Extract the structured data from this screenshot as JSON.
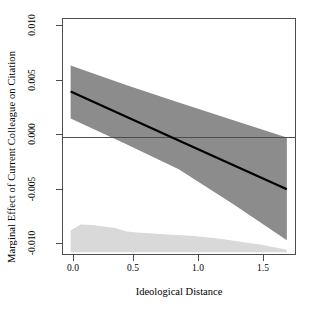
{
  "chart_data": {
    "type": "line",
    "title": "",
    "xlabel": "Ideological Distance",
    "ylabel": "Marginal Effect of Current Colleague on Citation",
    "xlim": [
      -0.06,
      1.78
    ],
    "ylim": [
      -0.0112,
      0.0112
    ],
    "xticks": [
      0.0,
      0.5,
      1.0,
      1.5
    ],
    "xticklabels": [
      "0.0",
      "0.5",
      "1.0",
      "1.5"
    ],
    "yticks": [
      0.01,
      0.005,
      0.0,
      -0.005,
      -0.01
    ],
    "yticklabels": [
      "0.010",
      "0.005",
      "0.000",
      "-0.005",
      "-0.010"
    ],
    "grid": false,
    "legend": null,
    "zero_reference_line": 0.0,
    "series": [
      {
        "name": "Marginal effect (fitted)",
        "type": "line",
        "color": "#000000",
        "linewidth": 2.2,
        "x": [
          0.0,
          0.85,
          1.7
        ],
        "values": [
          0.00435,
          -0.00028,
          -0.0049
        ]
      },
      {
        "name": "95% confidence interval upper",
        "type": "band_upper",
        "color": "#8c8c8c",
        "x": [
          0.0,
          0.43,
          0.85,
          1.28,
          1.7
        ],
        "values": [
          0.0068,
          0.00498,
          0.0033,
          0.00162,
          0.0
        ]
      },
      {
        "name": "95% confidence interval lower",
        "type": "band_lower",
        "color": "#8c8c8c",
        "x": [
          0.0,
          0.43,
          0.85,
          1.28,
          1.7
        ],
        "values": [
          0.0018,
          -0.00058,
          -0.003,
          -0.0063,
          -0.0097
        ]
      },
      {
        "name": "Distribution of Ideological Distance",
        "type": "area",
        "color": "#d9d9d9",
        "baseline": -0.01085,
        "x": [
          0.0,
          0.08,
          0.17,
          0.26,
          0.35,
          0.44,
          0.52,
          0.61,
          0.7,
          0.79,
          0.88,
          0.96,
          1.05,
          1.14,
          1.23,
          1.31,
          1.4,
          1.49,
          1.58,
          1.7
        ],
        "values": [
          -0.0088,
          -0.00822,
          -0.00826,
          -0.0084,
          -0.00855,
          -0.00888,
          -0.00898,
          -0.00905,
          -0.00912,
          -0.00918,
          -0.00925,
          -0.00932,
          -0.0094,
          -0.00952,
          -0.00966,
          -0.0098,
          -0.00996,
          -0.01012,
          -0.01032,
          -0.01062
        ]
      }
    ],
    "colors": {
      "line": "#000000",
      "confidence_band": "#8c8c8c",
      "density_area": "#d9d9d9",
      "axis": "#4d4d4d",
      "zero_line": "#4d4d4d",
      "background": "#ffffff"
    }
  }
}
